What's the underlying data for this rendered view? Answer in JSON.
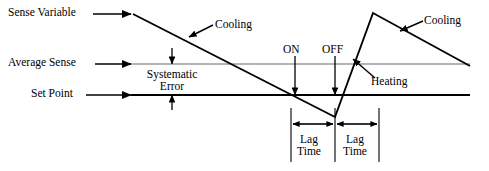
{
  "diagram": {
    "colors": {
      "ink": "#000000",
      "average_sense_line": "#6b6b6b",
      "background": "#ffffff"
    },
    "labels": {
      "sense_variable": "Sense Variable",
      "average_sense": "Average Sense",
      "set_point": "Set Point",
      "cooling_left": "Cooling",
      "cooling_right": "Cooling",
      "heating": "Heating",
      "on": "ON",
      "off": "OFF",
      "systematic_error_line1": "Systematic",
      "systematic_error_line2": "Error",
      "lag_time_1_line1": "Lag",
      "lag_time_1_line2": "Time",
      "lag_time_2_line1": "Lag",
      "lag_time_2_line2": "Time"
    }
  },
  "chart_data": {
    "type": "line",
    "xlabel": "",
    "ylabel": "",
    "grid": false,
    "legend": "none",
    "xlim": [
      0,
      489
    ],
    "ylim": [
      171,
      0
    ],
    "series": [
      {
        "name": "Sense Variable",
        "color": "#000000",
        "width": 1.9,
        "points": [
          [
            133,
            14
          ],
          [
            335,
            117
          ],
          [
            373,
            13
          ],
          [
            470,
            66
          ]
        ]
      },
      {
        "name": "Average Sense",
        "color": "#6b6b6b",
        "width": 1.2,
        "points": [
          [
            131,
            64
          ],
          [
            470,
            64
          ]
        ]
      },
      {
        "name": "Set Point",
        "color": "#000000",
        "width": 1.9,
        "points": [
          [
            131,
            95
          ],
          [
            470,
            95
          ]
        ]
      }
    ],
    "annotations": [
      {
        "text": "Sense Variable",
        "kind": "pointer-label",
        "arrow_from": [
          96,
          14
        ],
        "arrow_to": [
          133,
          14
        ]
      },
      {
        "text": "Average Sense",
        "kind": "pointer-label",
        "arrow_from": [
          96,
          64
        ],
        "arrow_to": [
          131,
          64
        ]
      },
      {
        "text": "Set Point",
        "kind": "pointer-label",
        "arrow_from": [
          96,
          95
        ],
        "arrow_to": [
          131,
          95
        ]
      },
      {
        "text": "Cooling",
        "kind": "pointer-label",
        "arrow_from": [
          212,
          26
        ],
        "arrow_to": [
          188,
          37
        ]
      },
      {
        "text": "Cooling",
        "kind": "pointer-label",
        "arrow_from": [
          422,
          22
        ],
        "arrow_to": [
          400,
          32
        ]
      },
      {
        "text": "Heating",
        "kind": "pointer-label",
        "arrow_from": [
          374,
          76
        ],
        "arrow_to": [
          352,
          58
        ]
      },
      {
        "text": "ON",
        "kind": "drop-arrow",
        "arrow_from": [
          295,
          57
        ],
        "arrow_to": [
          295,
          95
        ]
      },
      {
        "text": "OFF",
        "kind": "drop-arrow",
        "arrow_from": [
          335,
          57
        ],
        "arrow_to": [
          335,
          95
        ]
      },
      {
        "text": "Systematic Error",
        "kind": "double-arrow-vertical",
        "arrow_top": [
          172,
          48
        ],
        "arrow_bottom": [
          172,
          110
        ],
        "gap_top": 64,
        "gap_bottom": 95
      },
      {
        "text": "Lag Time",
        "kind": "double-arrow-horizontal",
        "from": [
          291,
          120
        ],
        "to": [
          332,
          120
        ]
      },
      {
        "text": "Lag Time",
        "kind": "double-arrow-horizontal",
        "from": [
          338,
          120
        ],
        "to": [
          378,
          120
        ]
      }
    ],
    "tick_lines": [
      {
        "x": 291,
        "y1": 108,
        "y2": 162
      },
      {
        "x": 335,
        "y1": 108,
        "y2": 162
      },
      {
        "x": 379,
        "y1": 108,
        "y2": 162
      }
    ]
  }
}
